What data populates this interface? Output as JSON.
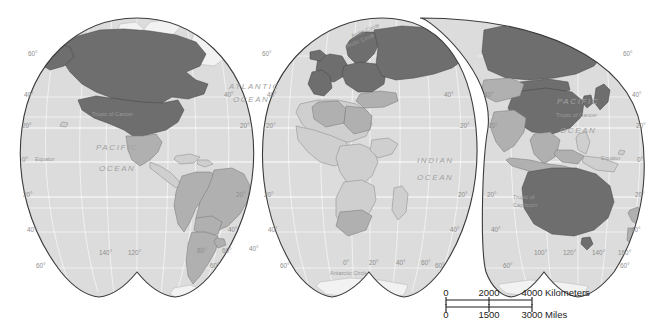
{
  "map": {
    "title": "World Map (interrupted Goode homolosine projection)",
    "projection": "goode-homolosine-interrupted",
    "background_color": "#ffffff",
    "ocean_color": "#dcdcdc",
    "outline_color": "#3b3b3b",
    "graticule_color": "#ffffff",
    "legend_classes": [
      {
        "key": "high",
        "color": "#6e6e6e",
        "label": "Highlighted countries"
      },
      {
        "key": "medium",
        "color": "#b0b0b0",
        "label": "Partially highlighted countries"
      },
      {
        "key": "low",
        "color": "#cfcfcf",
        "label": "Other countries"
      }
    ],
    "highlighted_countries": [
      "United States",
      "Canada",
      "Greenland",
      "Russia",
      "China",
      "Japan",
      "Australia",
      "United Kingdom",
      "Ireland",
      "France",
      "Germany",
      "Spain",
      "Portugal",
      "Italy",
      "Norway",
      "Sweden",
      "Finland",
      "Denmark",
      "Poland",
      "Ukraine",
      "Belarus",
      "Kazakhstan",
      "Mongolia",
      "South Korea",
      "Austria",
      "Switzerland",
      "Czechia",
      "Hungary",
      "Romania",
      "Greece",
      "Netherlands",
      "Belgium",
      "Baltic States"
    ],
    "medium_countries": [
      "Brazil",
      "Argentina",
      "Chile",
      "Peru",
      "Colombia",
      "Venezuela",
      "Mexico",
      "India",
      "Turkey",
      "Iran",
      "Saudi Arabia",
      "Algeria",
      "Libya",
      "Egypt",
      "South Africa",
      "Thailand",
      "Vietnam",
      "Indonesia",
      "Malaysia",
      "New Zealand",
      "Pakistan",
      "Afghanistan",
      "Uzbekistan",
      "Myanmar",
      "Bolivia",
      "Paraguay",
      "Uruguay",
      "Ecuador",
      "Morocco"
    ]
  },
  "labels": {
    "oceans": [
      {
        "name": "ATLANTIC",
        "x": 229,
        "y": 89
      },
      {
        "name": "OCEAN",
        "x": 233,
        "y": 102
      },
      {
        "name": "PACIFIC",
        "x": 96,
        "y": 150
      },
      {
        "name": "OCEAN",
        "x": 99,
        "y": 171
      },
      {
        "name": "INDIAN",
        "x": 417,
        "y": 163
      },
      {
        "name": "OCEAN",
        "x": 417,
        "y": 180
      },
      {
        "name": "PACIFIC",
        "x": 575,
        "y": 104
      },
      {
        "name": "OCEAN",
        "x": 578,
        "y": 133
      }
    ],
    "reference_lines": [
      {
        "name": "Arctic Circle",
        "x": 352,
        "y": 38,
        "rotate": -22
      },
      {
        "name": "Arctic Circle",
        "x": 350,
        "y": 47,
        "rotate": -22
      },
      {
        "name": "Tropic of Cancer",
        "x": 97,
        "y": 117,
        "rotate": 0
      },
      {
        "name": "Tropic of Cancer",
        "x": 563,
        "y": 118,
        "rotate": 0
      },
      {
        "name": "Equator",
        "x": 35,
        "y": 162,
        "rotate": 0
      },
      {
        "name": "Equator",
        "x": 606,
        "y": 161,
        "rotate": 0
      },
      {
        "name": "Tropic of",
        "x": 517,
        "y": 199,
        "rotate": 0
      },
      {
        "name": "Capricorn",
        "x": 517,
        "y": 207,
        "rotate": 0
      },
      {
        "name": "Antarctic Circle",
        "x": 333,
        "y": 275,
        "rotate": 0
      }
    ],
    "latitudes_left_lobe": [
      {
        "text": "60°",
        "x": 28,
        "y": 56
      },
      {
        "text": "40°",
        "x": 24,
        "y": 97
      },
      {
        "text": "20°",
        "x": 22,
        "y": 128
      },
      {
        "text": "0°",
        "x": 22,
        "y": 162
      },
      {
        "text": "20°",
        "x": 23,
        "y": 197
      },
      {
        "text": "40°",
        "x": 27,
        "y": 232
      },
      {
        "text": "60°",
        "x": 36,
        "y": 268
      }
    ],
    "latitudes_lobe1_right": [
      {
        "text": "40°",
        "x": 224,
        "y": 97
      },
      {
        "text": "20°",
        "x": 242,
        "y": 128
      },
      {
        "text": "20°",
        "x": 238,
        "y": 197
      },
      {
        "text": "40°",
        "x": 230,
        "y": 232
      },
      {
        "text": "60°",
        "x": 212,
        "y": 268
      }
    ],
    "latitudes_lobe2": [
      {
        "text": "60°",
        "x": 264,
        "y": 56
      },
      {
        "text": "40°",
        "x": 269,
        "y": 97
      },
      {
        "text": "20°",
        "x": 268,
        "y": 128
      },
      {
        "text": "20°",
        "x": 266,
        "y": 197
      },
      {
        "text": "40°",
        "x": 270,
        "y": 232
      },
      {
        "text": "60°",
        "x": 282,
        "y": 268
      }
    ],
    "latitudes_lobe2_right": [
      {
        "text": "40°",
        "x": 446,
        "y": 97
      },
      {
        "text": "20°",
        "x": 462,
        "y": 128
      },
      {
        "text": "20°",
        "x": 460,
        "y": 197
      },
      {
        "text": "40°",
        "x": 452,
        "y": 232
      },
      {
        "text": "60°",
        "x": 437,
        "y": 268
      }
    ],
    "latitudes_lobe3": [
      {
        "text": "40°",
        "x": 486,
        "y": 97
      },
      {
        "text": "20°",
        "x": 490,
        "y": 128
      },
      {
        "text": "20°",
        "x": 489,
        "y": 197
      },
      {
        "text": "40°",
        "x": 493,
        "y": 232
      },
      {
        "text": "60°",
        "x": 505,
        "y": 268
      }
    ],
    "latitudes_right_edge": [
      {
        "text": "60°",
        "x": 625,
        "y": 56
      },
      {
        "text": "40°",
        "x": 634,
        "y": 97
      },
      {
        "text": "20°",
        "x": 638,
        "y": 128
      },
      {
        "text": "0°",
        "x": 639,
        "y": 162
      },
      {
        "text": "20°",
        "x": 637,
        "y": 197
      },
      {
        "text": "40°",
        "x": 633,
        "y": 232
      },
      {
        "text": "60°",
        "x": 622,
        "y": 268
      }
    ],
    "longitudes": [
      {
        "text": "140°",
        "x": 99,
        "y": 255
      },
      {
        "text": "120°",
        "x": 128,
        "y": 255
      },
      {
        "text": "80°",
        "x": 197,
        "y": 253
      },
      {
        "text": "60°",
        "x": 222,
        "y": 253
      },
      {
        "text": "40°",
        "x": 249,
        "y": 251
      },
      {
        "text": "0°",
        "x": 343,
        "y": 265
      },
      {
        "text": "20°",
        "x": 369,
        "y": 265
      },
      {
        "text": "40°",
        "x": 396,
        "y": 265
      },
      {
        "text": "60°",
        "x": 421,
        "y": 265
      },
      {
        "text": "100°",
        "x": 534,
        "y": 255
      },
      {
        "text": "120°",
        "x": 563,
        "y": 255
      },
      {
        "text": "140°",
        "x": 592,
        "y": 255
      },
      {
        "text": "160°",
        "x": 618,
        "y": 255
      }
    ]
  },
  "scale_bar": {
    "kilometers": {
      "ticks": [
        "0",
        "2000",
        "4000"
      ],
      "unit_label": "Kilometers",
      "tick_x": [
        448,
        489,
        530
      ],
      "label_x": 534
    },
    "miles": {
      "ticks": [
        "0",
        "1500",
        "3000"
      ],
      "unit_label": "Miles",
      "tick_x": [
        448,
        489,
        530
      ],
      "label_x": 534
    }
  }
}
